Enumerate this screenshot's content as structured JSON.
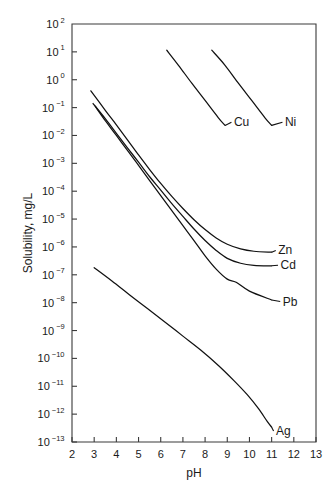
{
  "chart_data": {
    "type": "line",
    "title": "",
    "xlabel": "pH",
    "ylabel": "Solubility, mg/L",
    "xlim": [
      2,
      13
    ],
    "ylim": [
      1e-13,
      100
    ],
    "yscale": "log",
    "xscale": "linear",
    "grid": false,
    "legend_position": "inline-end-of-curve",
    "xticks": [
      2,
      3,
      4,
      5,
      6,
      7,
      8,
      9,
      10,
      11,
      12,
      13
    ],
    "xtick_labels": [
      "2",
      "3",
      "4",
      "5",
      "6",
      "7",
      "8",
      "9",
      "10",
      "11",
      "12",
      "13"
    ],
    "yticks": [
      100,
      10,
      1,
      0.1,
      0.01,
      0.001,
      0.0001,
      1e-05,
      1e-06,
      1e-07,
      1e-08,
      1e-09,
      1e-10,
      1e-11,
      1e-12,
      1e-13
    ],
    "ytick_labels": [
      {
        "mantissa": "10",
        "exponent": "2"
      },
      {
        "mantissa": "10",
        "exponent": "1"
      },
      {
        "mantissa": "10",
        "exponent": "0"
      },
      {
        "mantissa": "10",
        "exponent": "−1"
      },
      {
        "mantissa": "10",
        "exponent": "−2"
      },
      {
        "mantissa": "10",
        "exponent": "−3"
      },
      {
        "mantissa": "10",
        "exponent": "−4"
      },
      {
        "mantissa": "10",
        "exponent": "−5"
      },
      {
        "mantissa": "10",
        "exponent": "−6"
      },
      {
        "mantissa": "10",
        "exponent": "−7"
      },
      {
        "mantissa": "10",
        "exponent": "−8"
      },
      {
        "mantissa": "10",
        "exponent": "−9"
      },
      {
        "mantissa": "10",
        "exponent": "−10"
      },
      {
        "mantissa": "10",
        "exponent": "−11"
      },
      {
        "mantissa": "10",
        "exponent": "−12"
      },
      {
        "mantissa": "10",
        "exponent": "−13"
      }
    ],
    "series": [
      {
        "name": "Cu",
        "label": "Cu",
        "color": "#111111",
        "label_x": 9.3,
        "label_y": 0.03,
        "points": [
          {
            "x": 6.27,
            "y": 11.5
          },
          {
            "x": 6.8,
            "y": 3.3
          },
          {
            "x": 7.4,
            "y": 0.75
          },
          {
            "x": 8.0,
            "y": 0.18
          },
          {
            "x": 8.6,
            "y": 0.043
          },
          {
            "x": 8.9,
            "y": 0.023
          }
        ]
      },
      {
        "name": "Ni",
        "label": "Ni",
        "color": "#111111",
        "label_x": 11.6,
        "label_y": 0.03,
        "points": [
          {
            "x": 8.3,
            "y": 11.5
          },
          {
            "x": 8.9,
            "y": 3.3
          },
          {
            "x": 9.5,
            "y": 0.75
          },
          {
            "x": 10.1,
            "y": 0.18
          },
          {
            "x": 10.7,
            "y": 0.043
          },
          {
            "x": 11.0,
            "y": 0.023
          }
        ]
      },
      {
        "name": "Zn",
        "label": "Zn",
        "color": "#111111",
        "label_x": 11.3,
        "label_y": 7.5e-07,
        "points": [
          {
            "x": 2.85,
            "y": 0.4
          },
          {
            "x": 3.5,
            "y": 0.08
          },
          {
            "x": 4.0,
            "y": 0.024
          },
          {
            "x": 4.5,
            "y": 0.007
          },
          {
            "x": 5.0,
            "y": 0.002
          },
          {
            "x": 5.5,
            "y": 0.0006
          },
          {
            "x": 6.0,
            "y": 0.00019
          },
          {
            "x": 6.5,
            "y": 6.5e-05
          },
          {
            "x": 7.0,
            "y": 2.4e-05
          },
          {
            "x": 7.5,
            "y": 9.5e-06
          },
          {
            "x": 8.0,
            "y": 4.2e-06
          },
          {
            "x": 8.5,
            "y": 2.1e-06
          },
          {
            "x": 9.0,
            "y": 1.25e-06
          },
          {
            "x": 9.6,
            "y": 8.5e-07
          },
          {
            "x": 10.2,
            "y": 7e-07
          },
          {
            "x": 11.0,
            "y": 6.5e-07
          }
        ]
      },
      {
        "name": "Cd",
        "label": "Cd",
        "color": "#111111",
        "label_x": 11.4,
        "label_y": 2.2e-07,
        "points": [
          {
            "x": 2.95,
            "y": 0.14
          },
          {
            "x": 3.5,
            "y": 0.04
          },
          {
            "x": 4.0,
            "y": 0.012
          },
          {
            "x": 4.5,
            "y": 0.0036
          },
          {
            "x": 5.0,
            "y": 0.0011
          },
          {
            "x": 5.5,
            "y": 0.00033
          },
          {
            "x": 6.0,
            "y": 0.00011
          },
          {
            "x": 6.5,
            "y": 3.6e-05
          },
          {
            "x": 7.0,
            "y": 1.25e-05
          },
          {
            "x": 7.5,
            "y": 4.4e-06
          },
          {
            "x": 8.0,
            "y": 1.7e-06
          },
          {
            "x": 8.5,
            "y": 7.5e-07
          },
          {
            "x": 9.0,
            "y": 3.9e-07
          },
          {
            "x": 9.6,
            "y": 2.6e-07
          },
          {
            "x": 10.2,
            "y": 2.2e-07
          },
          {
            "x": 11.0,
            "y": 2.1e-07
          }
        ]
      },
      {
        "name": "Pb",
        "label": "Pb",
        "color": "#111111",
        "label_x": 11.5,
        "label_y": 1.1e-08,
        "points": [
          {
            "x": 3.05,
            "y": 0.11
          },
          {
            "x": 3.5,
            "y": 0.034
          },
          {
            "x": 4.0,
            "y": 0.01
          },
          {
            "x": 4.5,
            "y": 0.0029
          },
          {
            "x": 5.0,
            "y": 0.00085
          },
          {
            "x": 5.5,
            "y": 0.00024
          },
          {
            "x": 6.0,
            "y": 7e-05
          },
          {
            "x": 6.5,
            "y": 2e-05
          },
          {
            "x": 7.0,
            "y": 5.8e-06
          },
          {
            "x": 7.5,
            "y": 1.7e-06
          },
          {
            "x": 8.0,
            "y": 4.8e-07
          },
          {
            "x": 8.5,
            "y": 1.6e-07
          },
          {
            "x": 9.0,
            "y": 7e-08
          },
          {
            "x": 9.4,
            "y": 5.4e-08
          },
          {
            "x": 10.0,
            "y": 2.6e-08
          },
          {
            "x": 11.0,
            "y": 1.25e-08
          }
        ]
      },
      {
        "name": "Ag",
        "label": "Ag",
        "color": "#111111",
        "label_x": 11.2,
        "label_y": 2.5e-13,
        "points": [
          {
            "x": 3.0,
            "y": 1.8e-07
          },
          {
            "x": 3.8,
            "y": 6e-08
          },
          {
            "x": 4.6,
            "y": 1.9e-08
          },
          {
            "x": 5.4,
            "y": 6.2e-09
          },
          {
            "x": 6.2,
            "y": 2e-09
          },
          {
            "x": 7.0,
            "y": 6.3e-10
          },
          {
            "x": 7.8,
            "y": 2e-10
          },
          {
            "x": 8.6,
            "y": 5.6e-11
          },
          {
            "x": 9.3,
            "y": 1.6e-11
          },
          {
            "x": 9.9,
            "y": 5e-12
          },
          {
            "x": 10.4,
            "y": 1.6e-12
          },
          {
            "x": 10.8,
            "y": 5.5e-13
          },
          {
            "x": 11.0,
            "y": 3.4e-13
          }
        ]
      }
    ]
  },
  "axes": {
    "y_axis_title": "Solubility, mg/L",
    "x_axis_title": "pH"
  }
}
